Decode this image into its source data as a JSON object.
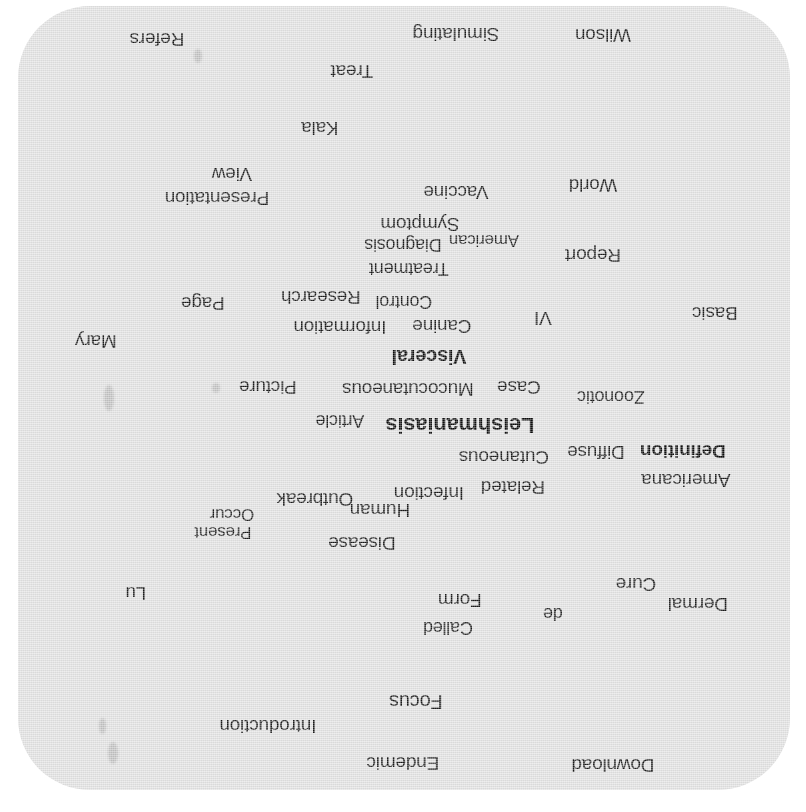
{
  "figure": {
    "kind": "word-cloud",
    "rotation_degrees": 180,
    "background_color": "#e2e2e2",
    "page_background_color": "#ffffff",
    "text_color": "#1a1a1a",
    "topic": "Leishmaniasis"
  },
  "chart_data": {
    "type": "table",
    "title": "",
    "xlabel": "",
    "ylabel": "",
    "layout": "word-cloud, entire cloud rotated 180 degrees (upside down)",
    "categories": [
      "Download",
      "Endemic",
      "Introduction",
      "Focus",
      "Called",
      "de",
      "Dermal",
      "Cure",
      "Form",
      "Lu",
      "Disease",
      "Present",
      "Occur",
      "Outbreak",
      "Human",
      "Infection",
      "Related",
      "Americana",
      "Cutaneous",
      "Definition",
      "Diffuse",
      "Leishmaniasis",
      "Article",
      "Zoonotic",
      "Case",
      "Mucocutaneous",
      "Picture",
      "Visceral",
      "Canine",
      "Information",
      "Mary",
      "Basic",
      "VI",
      "Control",
      "Research",
      "Page",
      "Report",
      "Treatment",
      "Diagnosis",
      "American",
      "Symptom",
      "Vaccine",
      "World",
      "Presentation",
      "View",
      "Kala",
      "Treat",
      "Refers",
      "Simulating",
      "Wilson"
    ],
    "values": [
      18,
      18,
      18,
      20,
      18,
      18,
      18,
      18,
      18,
      18,
      18,
      16,
      16,
      18,
      18,
      18,
      18,
      18,
      18,
      19,
      18,
      22,
      17,
      17,
      18,
      18,
      18,
      20,
      18,
      18,
      18,
      18,
      18,
      17,
      18,
      18,
      18,
      17,
      17,
      16,
      18,
      18,
      18,
      18,
      18,
      18,
      18,
      18,
      18,
      18
    ]
  },
  "words": [
    {
      "text": "Download",
      "x": 195,
      "y": 31,
      "size": 19,
      "bold": false
    },
    {
      "text": "Endemic",
      "x": 405,
      "y": 33,
      "size": 19,
      "bold": false
    },
    {
      "text": "Introduction",
      "x": 540,
      "y": 70,
      "size": 19,
      "bold": false
    },
    {
      "text": "Focus",
      "x": 392,
      "y": 94,
      "size": 20,
      "bold": false
    },
    {
      "text": "Called",
      "x": 360,
      "y": 168,
      "size": 18,
      "bold": false
    },
    {
      "text": "de",
      "x": 255,
      "y": 182,
      "size": 18,
      "bold": false
    },
    {
      "text": "Dermal",
      "x": 110,
      "y": 192,
      "size": 19,
      "bold": false
    },
    {
      "text": "Form",
      "x": 348,
      "y": 196,
      "size": 19,
      "bold": false
    },
    {
      "text": "Cure",
      "x": 172,
      "y": 212,
      "size": 19,
      "bold": false
    },
    {
      "text": "Lu",
      "x": 672,
      "y": 203,
      "size": 19,
      "bold": false
    },
    {
      "text": "Disease",
      "x": 446,
      "y": 253,
      "size": 19,
      "bold": false
    },
    {
      "text": "Present",
      "x": 585,
      "y": 264,
      "size": 17,
      "bold": false
    },
    {
      "text": "Occur",
      "x": 576,
      "y": 282,
      "size": 17,
      "bold": false
    },
    {
      "text": "Human",
      "x": 428,
      "y": 286,
      "size": 19,
      "bold": false
    },
    {
      "text": "Outbreak",
      "x": 493,
      "y": 297,
      "size": 19,
      "bold": false
    },
    {
      "text": "Infection",
      "x": 379,
      "y": 303,
      "size": 19,
      "bold": false
    },
    {
      "text": "Related",
      "x": 295,
      "y": 309,
      "size": 19,
      "bold": false
    },
    {
      "text": "Americana",
      "x": 122,
      "y": 316,
      "size": 19,
      "bold": false
    },
    {
      "text": "Cutaneous",
      "x": 304,
      "y": 339,
      "size": 19,
      "bold": false
    },
    {
      "text": "Diffuse",
      "x": 212,
      "y": 344,
      "size": 19,
      "bold": false
    },
    {
      "text": "Definition",
      "x": 125,
      "y": 345,
      "size": 19,
      "bold": true
    },
    {
      "text": "Leishmaniasis",
      "x": 348,
      "y": 371,
      "size": 22,
      "bold": true
    },
    {
      "text": "Article",
      "x": 468,
      "y": 375,
      "size": 18,
      "bold": false
    },
    {
      "text": "Zoonotic",
      "x": 197,
      "y": 399,
      "size": 18,
      "bold": false
    },
    {
      "text": "Case",
      "x": 289,
      "y": 409,
      "size": 19,
      "bold": false
    },
    {
      "text": "Mucocutaneous",
      "x": 400,
      "y": 407,
      "size": 19,
      "bold": false
    },
    {
      "text": "Picture",
      "x": 540,
      "y": 409,
      "size": 19,
      "bold": false
    },
    {
      "text": "Visceral",
      "x": 379,
      "y": 439,
      "size": 20,
      "bold": true
    },
    {
      "text": "Mary",
      "x": 712,
      "y": 455,
      "size": 19,
      "bold": false
    },
    {
      "text": "Canine",
      "x": 366,
      "y": 470,
      "size": 19,
      "bold": false
    },
    {
      "text": "Information",
      "x": 468,
      "y": 469,
      "size": 19,
      "bold": false
    },
    {
      "text": "VI",
      "x": 265,
      "y": 478,
      "size": 19,
      "bold": false
    },
    {
      "text": "Basic",
      "x": 93,
      "y": 483,
      "size": 19,
      "bold": false
    },
    {
      "text": "Control",
      "x": 404,
      "y": 494,
      "size": 18,
      "bold": false
    },
    {
      "text": "Research",
      "x": 487,
      "y": 499,
      "size": 19,
      "bold": false
    },
    {
      "text": "Page",
      "x": 605,
      "y": 493,
      "size": 19,
      "bold": false
    },
    {
      "text": "Treatment",
      "x": 399,
      "y": 527,
      "size": 18,
      "bold": false
    },
    {
      "text": "Report",
      "x": 215,
      "y": 541,
      "size": 19,
      "bold": false
    },
    {
      "text": "Diagnosis",
      "x": 405,
      "y": 551,
      "size": 18,
      "bold": false
    },
    {
      "text": "American",
      "x": 324,
      "y": 556,
      "size": 17,
      "bold": false
    },
    {
      "text": "Symptom",
      "x": 388,
      "y": 572,
      "size": 19,
      "bold": false
    },
    {
      "text": "Presentation",
      "x": 591,
      "y": 598,
      "size": 19,
      "bold": false
    },
    {
      "text": "Vaccine",
      "x": 352,
      "y": 604,
      "size": 19,
      "bold": false
    },
    {
      "text": "World",
      "x": 215,
      "y": 611,
      "size": 19,
      "bold": false
    },
    {
      "text": "View",
      "x": 576,
      "y": 622,
      "size": 19,
      "bold": false
    },
    {
      "text": "Kala",
      "x": 488,
      "y": 668,
      "size": 19,
      "bold": false
    },
    {
      "text": "Treat",
      "x": 456,
      "y": 725,
      "size": 19,
      "bold": false
    },
    {
      "text": "Refers",
      "x": 651,
      "y": 757,
      "size": 19,
      "bold": false
    },
    {
      "text": "Simulating",
      "x": 352,
      "y": 762,
      "size": 19,
      "bold": false
    },
    {
      "text": "Wilson",
      "x": 205,
      "y": 761,
      "size": 19,
      "bold": false
    }
  ],
  "smudges": [
    {
      "x": 690,
      "y": 32,
      "w": 10,
      "h": 22
    },
    {
      "x": 702,
      "y": 62,
      "w": 7,
      "h": 16
    },
    {
      "x": 694,
      "y": 385,
      "w": 10,
      "h": 26
    },
    {
      "x": 606,
      "y": 733,
      "w": 8,
      "h": 14
    },
    {
      "x": 588,
      "y": 403,
      "w": 8,
      "h": 10
    }
  ]
}
